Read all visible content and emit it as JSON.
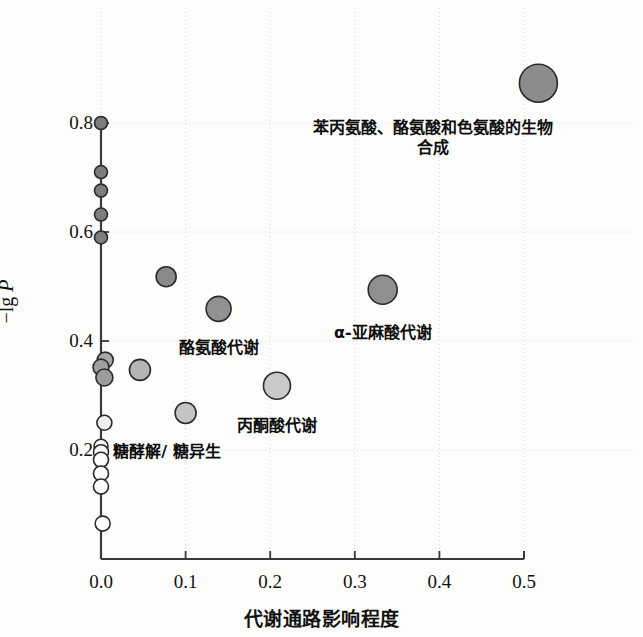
{
  "chart_data": {
    "type": "scatter",
    "title": "",
    "xlabel": "代谢通路影响程度",
    "ylabel": "-lg P",
    "xlim": [
      -0.015,
      0.53
    ],
    "ylim": [
      0.0,
      0.92
    ],
    "xticks": [
      0.0,
      0.1,
      0.2,
      0.3,
      0.4,
      0.5
    ],
    "xticklabels": [
      "0.0",
      "0.1",
      "0.2",
      "0.3",
      "0.4",
      "0.5"
    ],
    "yticks": [
      0.2,
      0.4,
      0.6,
      0.8
    ],
    "yticklabels": [
      "0.2",
      "0.4",
      "0.6",
      "0.8"
    ],
    "grid": true,
    "grid_style": "dotted",
    "size_encodes": "pathway impact / bubble size",
    "color_encodes": "-lg P (darker = higher significance)",
    "points": [
      {
        "x": 0.517,
        "y": 0.873,
        "r": 19.0,
        "fill": "#8c8c8c",
        "label": "苯丙氨酸、酪氨酸和色氨酸的生物合成"
      },
      {
        "x": 0.0,
        "y": 0.8,
        "r": 6.5,
        "fill": "#7d7d7d",
        "label": ""
      },
      {
        "x": 0.0,
        "y": 0.71,
        "r": 6.5,
        "fill": "#7d7d7d",
        "label": ""
      },
      {
        "x": 0.0,
        "y": 0.676,
        "r": 6.5,
        "fill": "#7d7d7d",
        "label": ""
      },
      {
        "x": 0.0,
        "y": 0.632,
        "r": 6.5,
        "fill": "#7d7d7d",
        "label": ""
      },
      {
        "x": 0.0,
        "y": 0.59,
        "r": 6.5,
        "fill": "#7d7d7d",
        "label": ""
      },
      {
        "x": 0.077,
        "y": 0.518,
        "r": 10.0,
        "fill": "#8a8a8a",
        "label": ""
      },
      {
        "x": 0.333,
        "y": 0.494,
        "r": 14.5,
        "fill": "#8f8f8f",
        "label": "α-亚麻酸代谢"
      },
      {
        "x": 0.139,
        "y": 0.459,
        "r": 12.5,
        "fill": "#919191",
        "label": "酪氨酸代谢"
      },
      {
        "x": 0.046,
        "y": 0.347,
        "r": 10.5,
        "fill": "#b4b4b4",
        "label": ""
      },
      {
        "x": 0.005,
        "y": 0.365,
        "r": 8.0,
        "fill": "#a8a8a8",
        "label": ""
      },
      {
        "x": 0.0,
        "y": 0.352,
        "r": 8.0,
        "fill": "#a0a0a0",
        "label": ""
      },
      {
        "x": 0.004,
        "y": 0.333,
        "r": 8.5,
        "fill": "#9c9c9c",
        "label": ""
      },
      {
        "x": 0.208,
        "y": 0.318,
        "r": 13.5,
        "fill": "#c9c9c9",
        "label": "丙酮酸代谢"
      },
      {
        "x": 0.1,
        "y": 0.268,
        "r": 10.5,
        "fill": "#c4c4c4",
        "label": ""
      },
      {
        "x": 0.004,
        "y": 0.25,
        "r": 7.5,
        "fill": "#efefef",
        "label": ""
      },
      {
        "x": 0.0,
        "y": 0.207,
        "r": 7.0,
        "fill": "#fafafa",
        "label": ""
      },
      {
        "x": 0.0,
        "y": 0.196,
        "r": 7.5,
        "fill": "#fafafa",
        "label": ""
      },
      {
        "x": 0.0,
        "y": 0.182,
        "r": 7.5,
        "fill": "#fcfcfc",
        "label": ""
      },
      {
        "x": 0.0,
        "y": 0.157,
        "r": 7.5,
        "fill": "#ffffff",
        "label": ""
      },
      {
        "x": 0.0,
        "y": 0.133,
        "r": 7.5,
        "fill": "#ffffff",
        "label": ""
      },
      {
        "x": 0.002,
        "y": 0.065,
        "r": 7.5,
        "fill": "#ffffff",
        "label": ""
      }
    ],
    "annotations": [
      {
        "text": "苯丙氨酸、酪氨酸和色氨酸的",
        "text2": "生物合成",
        "x": 0.393,
        "y": 0.79
      },
      {
        "text": "α-亚麻酸代谢",
        "x": 0.333,
        "y": 0.415
      },
      {
        "text": "酪氨酸代谢",
        "x": 0.139,
        "y": 0.388
      },
      {
        "text": "丙酮酸代谢",
        "x": 0.208,
        "y": 0.244
      },
      {
        "text": "糖酵解/ 糖异生",
        "x": 0.078,
        "y": 0.196
      }
    ]
  },
  "figure": {
    "axis_color": "#3a3a3a",
    "grid_color": "#d8d8d8",
    "point_edge_color": "#2a2a2a",
    "background": "#fdfdfc"
  }
}
